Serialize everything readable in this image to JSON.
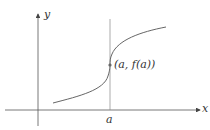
{
  "diagram": {
    "type": "function-graph",
    "axes": {
      "x_label": "x",
      "y_label": "y"
    },
    "tick_labels": {
      "a": "a"
    },
    "point": {
      "label": "(a, f(a))"
    },
    "colors": {
      "axis": "#555555",
      "curve": "#666666",
      "vertical_line": "#888888",
      "point": "#666666",
      "text": "#333333"
    }
  }
}
